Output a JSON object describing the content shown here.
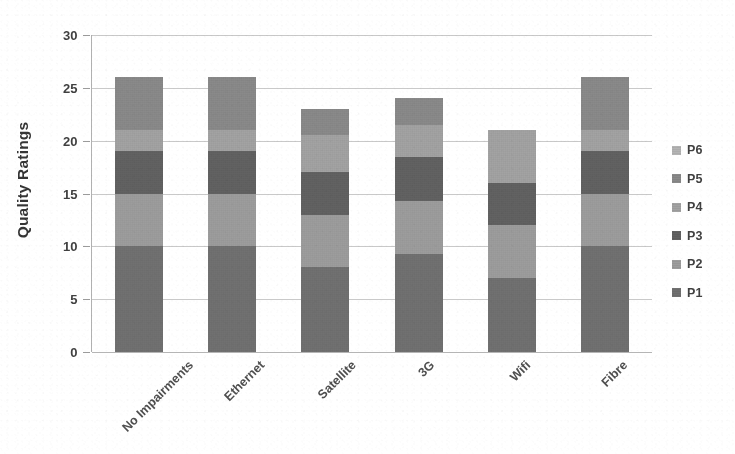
{
  "chart_data": {
    "type": "bar",
    "stacked": true,
    "title": "",
    "subtitle": "",
    "xlabel": "",
    "ylabel": "Quality Ratings",
    "ylim": [
      0,
      30
    ],
    "ytick_step": 5,
    "yticks": [
      0,
      5,
      10,
      15,
      20,
      25,
      30
    ],
    "ytick_labels": [
      "0",
      "5",
      "10",
      "15",
      "20",
      "25",
      "30"
    ],
    "grid": true,
    "grid_axis": "y",
    "legend_position": "right",
    "legend_entries": [
      "P6",
      "P5",
      "P4",
      "P3",
      "P2",
      "P1"
    ],
    "categories": [
      "No Impairments",
      "Ethernet",
      "Satellite",
      "3G",
      "Wifi",
      "Fibre"
    ],
    "series": [
      {
        "name": "P1",
        "values": [
          10,
          10,
          8,
          9.3,
          7,
          10
        ]
      },
      {
        "name": "P2",
        "values": [
          5,
          5,
          5,
          5,
          5,
          5
        ]
      },
      {
        "name": "P3",
        "values": [
          4,
          4,
          4,
          4.2,
          4,
          4
        ]
      },
      {
        "name": "P4",
        "values": [
          2,
          2,
          3.5,
          3,
          5,
          2
        ]
      },
      {
        "name": "P5",
        "values": [
          5,
          5,
          2.5,
          2.5,
          0,
          5
        ]
      },
      {
        "name": "P6",
        "values": [
          0,
          0,
          0,
          0,
          0,
          0
        ]
      }
    ],
    "totals": [
      26,
      26,
      23,
      24,
      21,
      26
    ],
    "colors": {
      "P1": "#6e6e6e",
      "P2": "#9c9c9c",
      "P3": "#5e5e5e",
      "P4": "#a2a2a2",
      "P5": "#888888",
      "P6": "#b4b4b4"
    },
    "background_color": "#ffffff",
    "grid_color": "#c9c9c9",
    "text_color": "#3a3a3a"
  }
}
